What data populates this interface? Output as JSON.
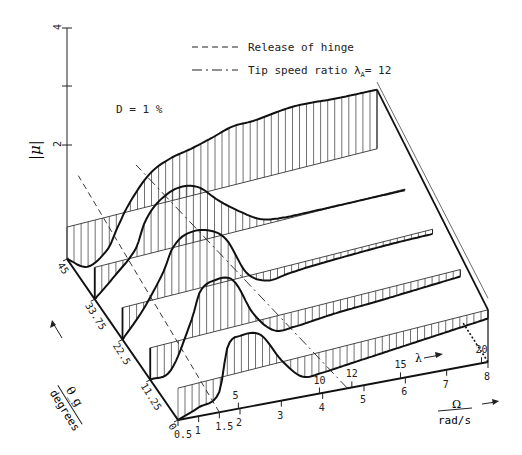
{
  "chart_data": {
    "type": "3d-surface-line",
    "title": "",
    "annotation_damping": "D = 1 %",
    "legend": [
      {
        "style": "dashed",
        "label": "Release of hinge"
      },
      {
        "style": "dash-dot",
        "label": "Tip speed ratio λ_A = 12",
        "text_main": "Tip speed ratio λ",
        "sub": "A",
        "text_after": "= 12"
      }
    ],
    "z_axis": {
      "label": "|μ|",
      "ticks": [
        2,
        4
      ],
      "range": [
        0,
        4
      ]
    },
    "theta_axis": {
      "label": "θ_g",
      "unit": "degrees",
      "ticks": [
        "0",
        "11.25",
        "22.5",
        "33.75",
        "45"
      ],
      "values": [
        0,
        11.25,
        22.5,
        33.75,
        45
      ]
    },
    "omega_axis": {
      "label": "Ω",
      "unit": "rad/s",
      "ticks": [
        "0.5",
        "1",
        "1.5",
        "2",
        "3",
        "4",
        "5",
        "6",
        "7",
        "8"
      ],
      "values": [
        0.5,
        1,
        1.5,
        2,
        3,
        4,
        5,
        6,
        7,
        8
      ]
    },
    "lambda_axis": {
      "label": "λ",
      "ticks": [
        "5",
        "10",
        "12",
        "15",
        "20"
      ],
      "values": [
        5,
        10,
        12,
        15,
        20
      ]
    },
    "omega_samples": [
      0.5,
      1.0,
      1.5,
      1.7,
      2.0,
      2.5,
      3.0,
      3.5,
      4.0,
      4.5,
      5.0,
      6.0,
      7.0,
      8.0
    ],
    "series": [
      {
        "name": "θ=0°",
        "theta": 0,
        "values": [
          0.0,
          0.15,
          0.35,
          1.1,
          1.25,
          1.2,
          0.7,
          0.35,
          0.35,
          0.4,
          0.45,
          0.55,
          0.65,
          0.75
        ]
      },
      {
        "name": "θ=11.25°",
        "theta": 11.25,
        "values": [
          0.0,
          0.1,
          0.9,
          1.35,
          1.5,
          1.45,
          0.8,
          0.45,
          0.45,
          0.5,
          0.55,
          0.62,
          0.7,
          0.78
        ]
      },
      {
        "name": "θ=22.5°",
        "theta": 22.5,
        "values": [
          0.0,
          0.45,
          1.05,
          1.4,
          1.6,
          1.62,
          1.4,
          0.75,
          0.55,
          0.6,
          0.65,
          0.72,
          0.78,
          0.82
        ]
      },
      {
        "name": "θ=33.75°",
        "theta": 33.75,
        "values": [
          0.0,
          0.35,
          0.75,
          1.15,
          1.45,
          1.65,
          1.6,
          1.3,
          1.05,
          0.85,
          0.8,
          0.82,
          0.85,
          0.88
        ]
      },
      {
        "name": "θ=45°",
        "theta": 45,
        "values": [
          0.0,
          -0.2,
          0.05,
          0.35,
          0.75,
          1.2,
          1.4,
          1.5,
          1.62,
          1.75,
          1.78,
          1.9,
          1.9,
          1.92
        ]
      }
    ],
    "reference_lines": [
      {
        "name": "release-of-hinge",
        "style": "dashed",
        "omega_at_theta0": 1.5
      },
      {
        "name": "tip-speed-ratio-12",
        "style": "dash-dot",
        "omega_at_theta0": 4.6
      }
    ],
    "grid": false
  }
}
